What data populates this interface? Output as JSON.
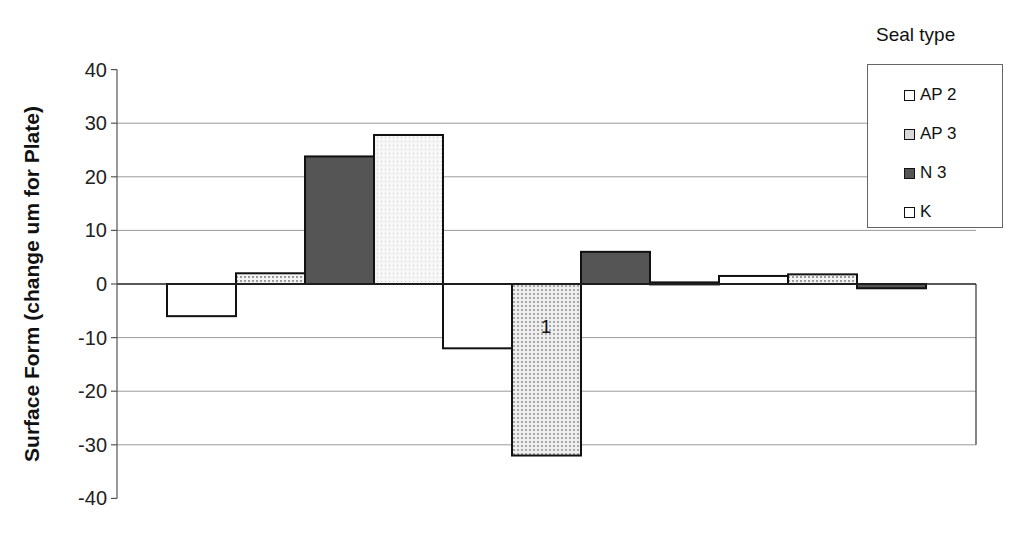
{
  "chart_data": {
    "type": "bar",
    "title": "",
    "xlabel": "",
    "ylabel": "Surface Form (change um for Plate)",
    "ylim": [
      -40,
      40
    ],
    "yticks": [
      40,
      30,
      20,
      10,
      0,
      -10,
      -20,
      -30,
      -40
    ],
    "grid": true,
    "legend_position": "top-right",
    "legend_title": "Seal type",
    "categories": [
      "Group 1",
      "Group 2",
      "Group 3"
    ],
    "series": [
      {
        "name": "AP 2",
        "values": [
          -6,
          -12,
          1.5
        ],
        "fill": "#ffffff",
        "pattern": "none"
      },
      {
        "name": "AP 3",
        "values": [
          2,
          -32,
          1.8
        ],
        "fill": "#dcdcdc",
        "pattern": "grid"
      },
      {
        "name": "N 3",
        "values": [
          23.8,
          6,
          -0.8
        ],
        "fill": "#555555",
        "pattern": "solid"
      },
      {
        "name": "K",
        "values": [
          27.8,
          0.3,
          null
        ],
        "fill": "#f0f0f0",
        "pattern": "dots"
      }
    ],
    "annotations": [
      {
        "text": "1",
        "series": "AP 3",
        "category": "Group 2"
      }
    ]
  },
  "legend": {
    "title": "Seal type",
    "items": [
      {
        "label": "AP 2"
      },
      {
        "label": "AP 3"
      },
      {
        "label": "N 3"
      },
      {
        "label": "K"
      }
    ]
  },
  "axis": {
    "ylabel": "Surface Form (change um for Plate)"
  }
}
